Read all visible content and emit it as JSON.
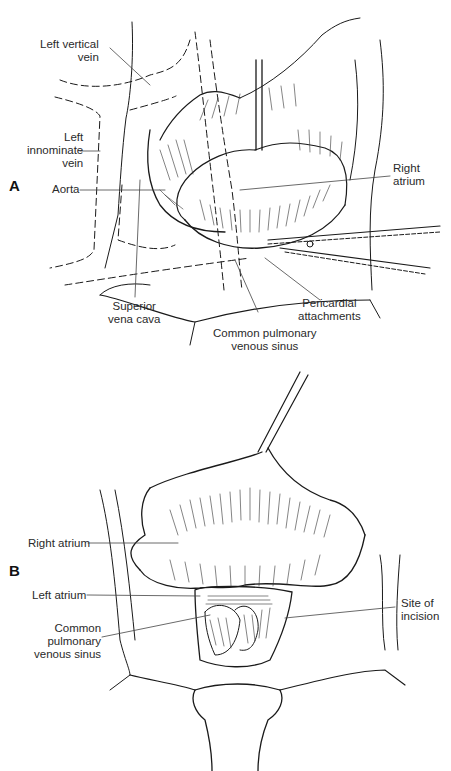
{
  "figure": {
    "panels": [
      {
        "id": "A",
        "letter": "A",
        "labels": {
          "left_vertical_vein": [
            "Left vertical",
            "vein"
          ],
          "left_innominate_vein": [
            "Left",
            "innominate",
            "vein"
          ],
          "aorta": [
            "Aorta"
          ],
          "right_atrium": [
            "Right",
            "atrium"
          ],
          "superior_vena_cava": [
            "Superior",
            "vena cava"
          ],
          "pericardial_attachments": [
            "Pericardial",
            "attachments"
          ],
          "common_pulmonary_venous_sinus": [
            "Common pulmonary",
            "venous sinus"
          ]
        }
      },
      {
        "id": "B",
        "letter": "B",
        "labels": {
          "right_atrium": [
            "Right atrium"
          ],
          "left_atrium": [
            "Left atrium"
          ],
          "common_pulmonary_venous_sinus": [
            "Common",
            "pulmonary",
            "venous sinus"
          ],
          "site_of_incision": [
            "Site of",
            "incision"
          ]
        }
      }
    ],
    "colors": {
      "line": "#1a1a1a",
      "leader": "#444444",
      "background": "#ffffff"
    }
  }
}
